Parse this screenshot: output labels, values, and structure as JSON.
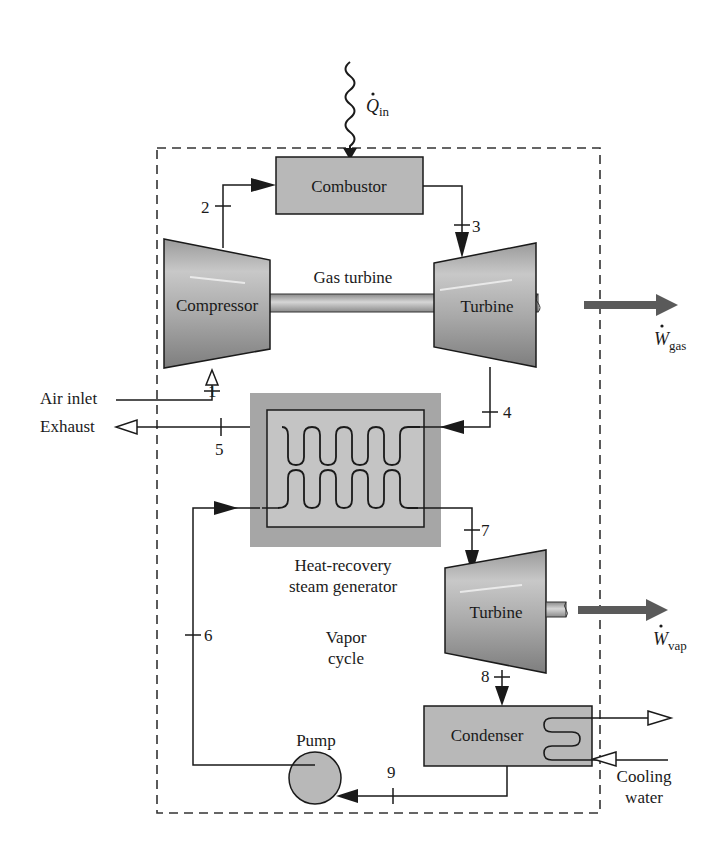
{
  "diagram": {
    "type": "combined gas-turbine vapor power plant schematic",
    "components": {
      "combustor": "Combustor",
      "compressor": "Compressor",
      "gas_turbine_label": "Gas turbine",
      "gas_turbine": "Turbine",
      "hrsg_line1": "Heat-recovery",
      "hrsg_line2": "steam generator",
      "vapor_cycle_line1": "Vapor",
      "vapor_cycle_line2": "cycle",
      "vapor_turbine": "Turbine",
      "condenser": "Condenser",
      "pump": "Pump"
    },
    "flows": {
      "heat_in": {
        "symbol": "Q",
        "subscript": "in"
      },
      "work_gas": {
        "symbol": "W",
        "subscript": "gas"
      },
      "work_vap": {
        "symbol": "W",
        "subscript": "vap"
      },
      "air_inlet": "Air inlet",
      "exhaust": "Exhaust",
      "cooling_water_line1": "Cooling",
      "cooling_water_line2": "water"
    },
    "state_points": [
      "1",
      "2",
      "3",
      "4",
      "5",
      "6",
      "7",
      "8",
      "9"
    ],
    "colors": {
      "component_fill": "#b8b8b8",
      "hrsg_outer": "#a6a6a6",
      "hrsg_inner": "#c4c4c4",
      "work_arrow": "#5a5a5a",
      "line": "#1a1a1a"
    }
  }
}
